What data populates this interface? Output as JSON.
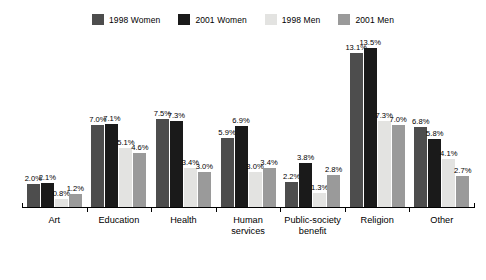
{
  "chart_data": {
    "type": "bar",
    "title": "",
    "subtitle": "",
    "xlabel": "",
    "ylabel": "",
    "ylim": [
      0,
      13.5
    ],
    "grid": false,
    "legend_position": "top-center",
    "value_suffix": "%",
    "categories": [
      "Art",
      "Education",
      "Health",
      "Human\nservices",
      "Public-society\nbenefit",
      "Religion",
      "Other"
    ],
    "series": [
      {
        "name": "1998 Women",
        "color": "#4d4d4d",
        "values": [
          2.0,
          7.0,
          7.5,
          5.9,
          2.2,
          13.1,
          6.8
        ],
        "labels": [
          "2.0%",
          "7.0%",
          "7.5%",
          "5.9%",
          "2.2%",
          "13.1%",
          "6.8%"
        ]
      },
      {
        "name": "2001 Women",
        "color": "#1a1a1a",
        "values": [
          2.1,
          7.1,
          7.3,
          6.9,
          3.8,
          13.5,
          5.8
        ],
        "labels": [
          "2.1%",
          "7.1%",
          "7.3%",
          "6.9%",
          "3.8%",
          "13.5%",
          "5.8%"
        ]
      },
      {
        "name": "1998 Men",
        "color": "#e3e3e1",
        "values": [
          0.8,
          5.1,
          3.4,
          3.0,
          1.3,
          7.3,
          4.1
        ],
        "labels": [
          "0.8%",
          "5.1%",
          "3.4%",
          "3.0%",
          "1.3%",
          "7.3%",
          "4.1%"
        ]
      },
      {
        "name": "2001 Men",
        "color": "#9a9a9a",
        "values": [
          1.2,
          4.6,
          3.0,
          3.4,
          2.8,
          7.0,
          2.7
        ],
        "labels": [
          "1.2%",
          "4.6%",
          "3.0%",
          "3.4%",
          "2.8%",
          "7.0%",
          "2.7%"
        ]
      }
    ]
  }
}
